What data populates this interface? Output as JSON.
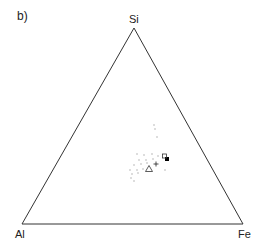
{
  "panel_label": "b)",
  "diagram": {
    "type": "ternary",
    "vertices": {
      "top": "Si",
      "bottom_left": "Al",
      "bottom_right": "Fe"
    },
    "line_color": "#333333",
    "markers": [
      {
        "shape": "filled-square",
        "name": "filled-square-marker",
        "x": 167,
        "y": 159
      },
      {
        "shape": "open-square",
        "name": "open-square-marker",
        "x": 164.5,
        "y": 156
      },
      {
        "shape": "plus",
        "name": "plus-marker",
        "x": 156,
        "y": 164
      },
      {
        "shape": "open-triangle",
        "name": "open-triangle-marker",
        "x": 149,
        "y": 169
      }
    ],
    "scatter_dots": [
      [
        154,
        125
      ],
      [
        155,
        129
      ],
      [
        157,
        137
      ],
      [
        137,
        154
      ],
      [
        144,
        155
      ],
      [
        152,
        154
      ],
      [
        158,
        156
      ],
      [
        139,
        160
      ],
      [
        146,
        160
      ],
      [
        153,
        159
      ],
      [
        134,
        165
      ],
      [
        141,
        164
      ],
      [
        147,
        163
      ],
      [
        130,
        170
      ],
      [
        137,
        170
      ],
      [
        143,
        169
      ],
      [
        165,
        170
      ],
      [
        132,
        174
      ],
      [
        138,
        173
      ],
      [
        131,
        178
      ],
      [
        134,
        181
      ]
    ]
  }
}
